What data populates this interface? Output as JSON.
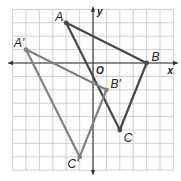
{
  "grid": {
    "x_min": -6,
    "x_max": 6,
    "y_min": -8,
    "y_max": 4,
    "origin_px": [
      93,
      63
    ],
    "cell_px": 13.4,
    "grid_color": "#c4c4c4",
    "axis_color": "#333333"
  },
  "axes": {
    "x_label": "x",
    "y_label": "y",
    "origin_label": "O"
  },
  "chart_data": {
    "type": "diagram",
    "title": "",
    "xlim": [
      -6,
      6
    ],
    "ylim": [
      -8,
      4
    ],
    "grid": true,
    "translation": [
      -3,
      -2
    ],
    "shapes": [
      {
        "name": "ABC",
        "color": "#474747",
        "points": [
          {
            "label": "A",
            "x": -2,
            "y": 3
          },
          {
            "label": "B",
            "x": 4,
            "y": 0
          },
          {
            "label": "C",
            "x": 2,
            "y": -5
          }
        ]
      },
      {
        "name": "A'B'C'",
        "color": "#808080",
        "points": [
          {
            "label": "A'",
            "x": -5,
            "y": 1
          },
          {
            "label": "B'",
            "x": 1,
            "y": -2
          },
          {
            "label": "C'",
            "x": -1,
            "y": -7
          }
        ]
      }
    ]
  }
}
